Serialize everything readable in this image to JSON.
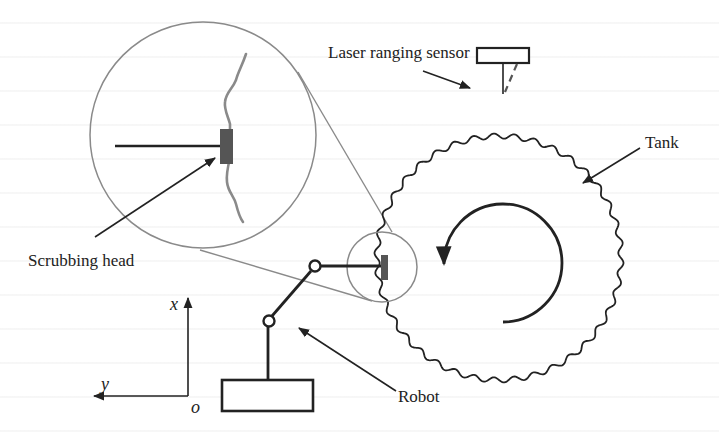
{
  "figure": {
    "labels": {
      "laser_sensor": "Laser ranging sensor",
      "tank": "Tank",
      "scrubbing_head": "Scrubbing head",
      "robot": "Robot"
    },
    "axes": {
      "x": "x",
      "y": "y",
      "origin": "o"
    },
    "colors": {
      "line": "#222222",
      "magnifier": "#8a8a8a",
      "scrub_head": "#555555",
      "background": "#ffffff"
    }
  }
}
